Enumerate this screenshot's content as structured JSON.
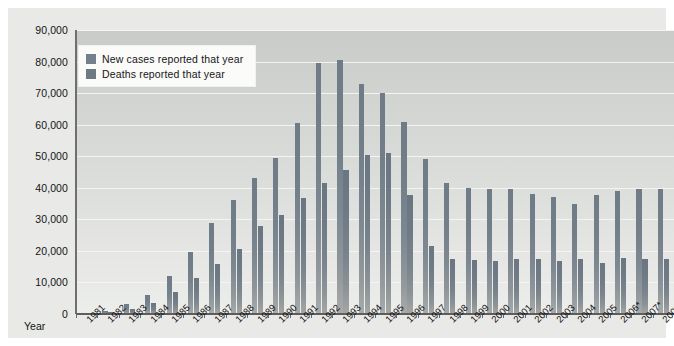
{
  "axis": {
    "y_caption": "Year",
    "y_ticks": [
      "0",
      "10,000",
      "20,000",
      "30,000",
      "40,000",
      "50,000",
      "60,000",
      "70,000",
      "80,000",
      "90,000"
    ]
  },
  "legend": {
    "items": [
      {
        "label": "New cases reported that year",
        "color": "#74808b",
        "key": "new"
      },
      {
        "label": "Deaths reported that year",
        "color": "#6d7983",
        "key": "deaths"
      }
    ]
  },
  "colors": {
    "panel_bg": "#e9e9e7",
    "plot_bg": "#d6d8d6",
    "gridline": "#f4f5f3",
    "new_cases_bar": "#74808b",
    "deaths_bar": "#6d7983",
    "axis_line": "#6a6a6a",
    "text": "#141414"
  },
  "chart_data": {
    "type": "bar",
    "title": "",
    "subtitle": "",
    "xlabel": "Year",
    "ylabel": "",
    "ylim": [
      0,
      90000
    ],
    "ytick_step": 10000,
    "grid": true,
    "legend_position": "top-left",
    "categories": [
      "1981",
      "1982",
      "1983",
      "1984",
      "1985",
      "1986",
      "1987",
      "1988",
      "1989",
      "1990",
      "1991",
      "1992",
      "1993",
      "1994",
      "1995",
      "1996",
      "1997",
      "1998",
      "1999",
      "2000",
      "2001",
      "2002",
      "2003",
      "2004",
      "2005",
      "2006*",
      "2007*",
      "2008*"
    ],
    "series": [
      {
        "name": "New cases reported that year",
        "color": "#74808b",
        "values": [
          300,
          1100,
          3100,
          6000,
          12000,
          19500,
          29000,
          36000,
          43000,
          49500,
          60500,
          79500,
          80500,
          73000,
          70000,
          61000,
          49000,
          41500,
          40000,
          39500,
          39500,
          38000,
          37000,
          35000,
          37800,
          39000,
          39500,
          39500
        ]
      },
      {
        "name": "Deaths reported that year",
        "color": "#6d7983",
        "values": [
          120,
          500,
          1500,
          3500,
          7000,
          11500,
          16000,
          20500,
          27800,
          31500,
          36800,
          41500,
          45500,
          50500,
          51000,
          37800,
          21500,
          17500,
          17200,
          16800,
          17500,
          17500,
          16800,
          17500,
          16300,
          17700,
          17500,
          17500
        ]
      }
    ]
  }
}
